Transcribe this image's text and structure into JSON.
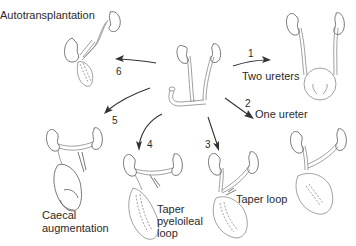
{
  "diagram": {
    "type": "urinary diversion options",
    "center": {
      "label": "",
      "description": "two kidneys with ureters and ileal conduit loop"
    },
    "options": [
      {
        "number": "1",
        "label": "Two ureters"
      },
      {
        "number": "2",
        "label": "One ureter"
      },
      {
        "number": "3",
        "label": "Taper loop"
      },
      {
        "number": "4",
        "label": "Taper pyeloileal loop",
        "lines": [
          "Taper",
          "pyeloileal",
          "loop"
        ]
      },
      {
        "number": "5",
        "label": "Caecal augmentation",
        "lines": [
          "Caecal",
          "augmentation"
        ]
      },
      {
        "number": "6",
        "label": "Autotransplantation"
      }
    ],
    "colors": {
      "line": "#555555",
      "text": "#2a2a2a",
      "background": "#ffffff"
    }
  }
}
